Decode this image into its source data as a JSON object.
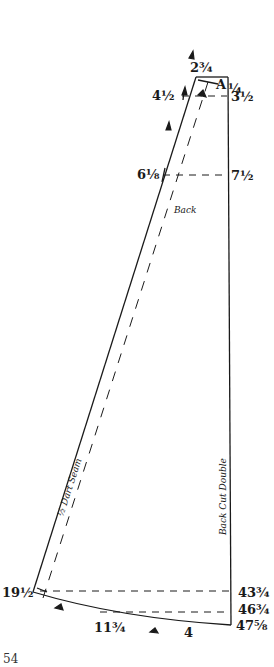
{
  "diagram": {
    "type": "sewing-pattern-draft",
    "piece_label": "Back",
    "fold_label": "Back Cut Double",
    "seam_label": "½ Dart Seam",
    "corner_label": "A",
    "measurements": {
      "top": "2¾",
      "top_right": "¼",
      "left_1": "4½",
      "right_1": "3½",
      "left_2": "6⅛",
      "right_2": "7½",
      "bottom_left": "19½",
      "right_3": "43¾",
      "right_4": "46¾",
      "bottom_right": "47⅝",
      "bottom_mid": "11¾",
      "bottom_center": "4"
    },
    "colors": {
      "line": "#1a1a1a",
      "background": "#ffffff"
    }
  },
  "page": {
    "number": "54"
  }
}
